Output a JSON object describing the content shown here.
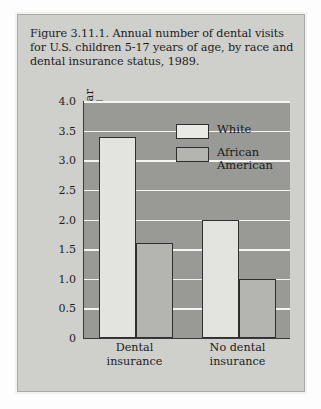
{
  "figure": {
    "title": "Figure 3.11.1. Annual number of dental visits for U.S. children 5-17 years of age, by race and dental insurance status, 1989."
  },
  "chart_data": {
    "type": "bar",
    "title": "Figure 3.11.1. Annual number of dental visits for U.S. children 5-17 years of age, by race and dental insurance status, 1989.",
    "xlabel": "",
    "ylabel": "Number of dental visits per year",
    "categories": [
      "Dental\ninsurance",
      "No dental\ninsurance"
    ],
    "series": [
      {
        "name": "White",
        "values": [
          3.4,
          2.0
        ],
        "color": "#e3e3df"
      },
      {
        "name": "African\nAmerican",
        "values": [
          1.6,
          1.0
        ],
        "color": "#b4b4b0"
      }
    ],
    "ylim": [
      0,
      4.0
    ],
    "yticks": [
      "4.0",
      "3.5",
      "3.0",
      "2.5",
      "2.0",
      "1.5",
      "1.0",
      "0.5",
      "0"
    ],
    "ytick_values": [
      4.0,
      3.5,
      3.0,
      2.5,
      2.0,
      1.5,
      1.0,
      0.5,
      0
    ],
    "grid": true,
    "legend_position": "upper-center",
    "plot_background": "#999995",
    "gridline_color": "#f4f4f2",
    "card_background": "#cfcfcb"
  }
}
